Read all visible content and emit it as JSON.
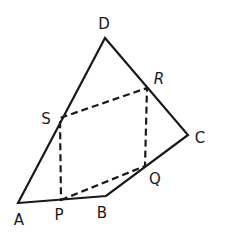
{
  "diagram": {
    "type": "quadrilateral-midpoints",
    "vertices": {
      "A": {
        "label": "A",
        "x": 18,
        "y": 203,
        "lx": 19,
        "ly": 225
      },
      "B": {
        "label": "B",
        "x": 106,
        "y": 196,
        "lx": 102,
        "ly": 218
      },
      "C": {
        "label": "C",
        "x": 188,
        "y": 135,
        "lx": 200,
        "ly": 143
      },
      "D": {
        "label": "D",
        "x": 105,
        "y": 38,
        "lx": 104,
        "ly": 29
      }
    },
    "midpoints": {
      "P": {
        "label": "P",
        "x": 61,
        "y": 200,
        "lx": 59,
        "ly": 220
      },
      "Q": {
        "label": "Q",
        "x": 145,
        "y": 166,
        "lx": 155,
        "ly": 184
      },
      "R": {
        "label": "R",
        "x": 147,
        "y": 88,
        "lx": 159,
        "ly": 84
      },
      "S": {
        "label": "S",
        "x": 60,
        "y": 118,
        "lx": 46,
        "ly": 124
      }
    },
    "solid_edges": [
      "AB",
      "BC",
      "CD",
      "DA"
    ],
    "dashed_edges": [
      "PQ",
      "QR",
      "RS",
      "SP"
    ]
  }
}
